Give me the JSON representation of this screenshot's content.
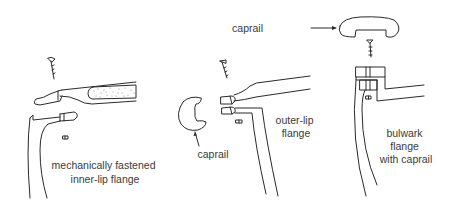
{
  "figure": {
    "background": "#ffffff",
    "stroke_color": "#2a2a2a",
    "text_color": "#3a3a3a"
  },
  "panels": [
    {
      "id": "inner-lip",
      "label_lines": [
        "mechanically fastened",
        "inner-lip flange"
      ]
    },
    {
      "id": "outer-lip",
      "label_lines": [
        "outer-lip",
        "flange"
      ],
      "callout": "caprail"
    },
    {
      "id": "bulwark",
      "label_lines": [
        "bulwark",
        "flange",
        "with caprail"
      ],
      "callout": "caprail"
    }
  ]
}
